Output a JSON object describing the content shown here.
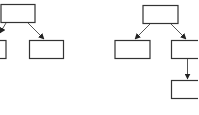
{
  "diagram": {
    "type": "tree",
    "colors": {
      "stroke": "#333333",
      "arrow": "#222222",
      "background": "#ffffff"
    },
    "trees": [
      {
        "name": "left-tree",
        "nodes": [
          {
            "id": "root",
            "label": ""
          },
          {
            "id": "child-left",
            "label": ""
          },
          {
            "id": "child-right",
            "label": ""
          }
        ],
        "edges": [
          [
            "root",
            "child-left"
          ],
          [
            "root",
            "child-right"
          ]
        ]
      },
      {
        "name": "right-tree",
        "nodes": [
          {
            "id": "root",
            "label": ""
          },
          {
            "id": "child-left",
            "label": ""
          },
          {
            "id": "child-right",
            "label": ""
          },
          {
            "id": "grandchild",
            "label": ""
          }
        ],
        "edges": [
          [
            "root",
            "child-left"
          ],
          [
            "root",
            "child-right"
          ],
          [
            "child-right",
            "grandchild"
          ]
        ]
      }
    ]
  }
}
